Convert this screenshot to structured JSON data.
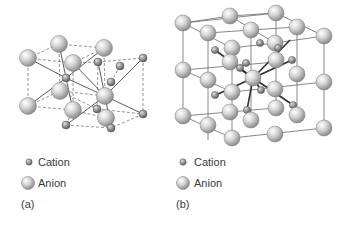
{
  "figure": {
    "panels": [
      {
        "id": "a",
        "label": "(a)",
        "legend": {
          "cation": "Cation",
          "anion": "Anion"
        },
        "bonds_dashed": [
          [
            28,
            58,
            59,
            44
          ],
          [
            59,
            44,
            104,
            48
          ],
          [
            28,
            58,
            73,
            63
          ],
          [
            73,
            63,
            104,
            48
          ],
          [
            28,
            58,
            28,
            106
          ],
          [
            28,
            106,
            60,
            91
          ],
          [
            28,
            106,
            73,
            110
          ],
          [
            73,
            110,
            106,
            118
          ],
          [
            60,
            91,
            105,
            96
          ],
          [
            104,
            48,
            105,
            96
          ],
          [
            73,
            63,
            73,
            110
          ],
          [
            59,
            44,
            60,
            91
          ],
          [
            98,
            62,
            143,
            58
          ],
          [
            143,
            58,
            143,
            114
          ],
          [
            143,
            114,
            111,
            128
          ],
          [
            66,
            125,
            111,
            128
          ],
          [
            66,
            125,
            73,
            110
          ],
          [
            98,
            62,
            97,
            109
          ],
          [
            120,
            66,
            111,
            82
          ],
          [
            60,
            91,
            97,
            109
          ],
          [
            97,
            109,
            143,
            114
          ],
          [
            73,
            63,
            98,
            62
          ]
        ],
        "bonds_solid": [
          [
            66,
            78,
            28,
            58
          ],
          [
            66,
            78,
            104,
            48
          ],
          [
            66,
            78,
            28,
            106
          ],
          [
            66,
            78,
            105,
            96
          ],
          [
            66,
            78,
            59,
            44
          ],
          [
            66,
            78,
            73,
            110
          ],
          [
            105,
            96,
            143,
            58
          ],
          [
            105,
            96,
            66,
            125
          ],
          [
            105,
            96,
            143,
            114
          ],
          [
            105,
            96,
            98,
            62
          ],
          [
            105,
            96,
            111,
            128
          ],
          [
            105,
            96,
            73,
            63
          ]
        ],
        "cations": [
          [
            66,
            78
          ],
          [
            98,
            62
          ],
          [
            120,
            66
          ],
          [
            111,
            82
          ],
          [
            97,
            109
          ],
          [
            143,
            58
          ],
          [
            143,
            114
          ],
          [
            66,
            125
          ],
          [
            111,
            128
          ]
        ],
        "anions": [
          [
            59,
            44
          ],
          [
            104,
            48
          ],
          [
            28,
            58
          ],
          [
            73,
            63
          ],
          [
            60,
            91
          ],
          [
            105,
            96
          ],
          [
            28,
            106
          ],
          [
            73,
            110
          ],
          [
            106,
            118
          ]
        ]
      },
      {
        "id": "b",
        "label": "(b)",
        "legend": {
          "cation": "Cation",
          "anion": "Anion"
        },
        "grid_lines": [
          [
            183,
            23,
            230,
            16
          ],
          [
            230,
            16,
            276,
            13
          ],
          [
            183,
            23,
            276,
            13
          ],
          [
            208,
            33,
            251,
            30
          ],
          [
            251,
            30,
            297,
            27
          ],
          [
            232,
            48,
            275,
            43
          ],
          [
            275,
            43,
            324,
            36
          ],
          [
            183,
            23,
            232,
            48
          ],
          [
            230,
            16,
            275,
            43
          ],
          [
            276,
            13,
            324,
            36
          ],
          [
            208,
            33,
            208,
            140
          ],
          [
            183,
            23,
            183,
            116
          ],
          [
            232,
            48,
            232,
            138
          ],
          [
            324,
            36,
            324,
            128
          ],
          [
            183,
            116,
            232,
            138
          ],
          [
            232,
            138,
            324,
            128
          ],
          [
            183,
            116,
            276,
            108
          ],
          [
            183,
            70,
            232,
            92
          ],
          [
            232,
            92,
            324,
            82
          ],
          [
            183,
            70,
            276,
            62
          ],
          [
            276,
            13,
            276,
            108
          ],
          [
            251,
            30,
            251,
            118
          ],
          [
            297,
            27,
            297,
            115
          ]
        ],
        "bonds_solid": [
          [
            253,
            78,
            215,
            50
          ],
          [
            253,
            78,
            290,
            40
          ],
          [
            253,
            78,
            292,
            60
          ],
          [
            253,
            78,
            216,
            95
          ],
          [
            253,
            78,
            247,
            110
          ],
          [
            253,
            78,
            293,
            105
          ],
          [
            253,
            78,
            232,
            63
          ],
          [
            253,
            78,
            261,
            90
          ]
        ],
        "cations": [
          [
            215,
            50
          ],
          [
            260,
            43
          ],
          [
            292,
            60
          ],
          [
            246,
            63
          ],
          [
            215,
            95
          ],
          [
            261,
            90
          ],
          [
            247,
            110
          ],
          [
            293,
            105
          ],
          [
            278,
            48
          ],
          [
            240,
            68
          ]
        ],
        "anions": [
          [
            183,
            23
          ],
          [
            230,
            16
          ],
          [
            276,
            13
          ],
          [
            208,
            33
          ],
          [
            251,
            30
          ],
          [
            297,
            27
          ],
          [
            232,
            48
          ],
          [
            275,
            43
          ],
          [
            324,
            36
          ],
          [
            183,
            70
          ],
          [
            230,
            62
          ],
          [
            276,
            60
          ],
          [
            208,
            80
          ],
          [
            253,
            78
          ],
          [
            297,
            74
          ],
          [
            232,
            92
          ],
          [
            275,
            89
          ],
          [
            324,
            82
          ],
          [
            183,
            116
          ],
          [
            230,
            112
          ],
          [
            276,
            108
          ],
          [
            208,
            125
          ],
          [
            251,
            120
          ],
          [
            297,
            115
          ],
          [
            232,
            138
          ],
          [
            275,
            134
          ],
          [
            324,
            128
          ]
        ]
      }
    ],
    "colors": {
      "atom_light": "#f2f2f2",
      "atom_mid": "#c8c8c8",
      "atom_dark": "#8e8e8e",
      "cation_dark": "#6f6f6f",
      "bond_solid": "#4a4a4a",
      "bond_dashed": "#7a7a7a",
      "grid": "#6a6a6a"
    }
  }
}
